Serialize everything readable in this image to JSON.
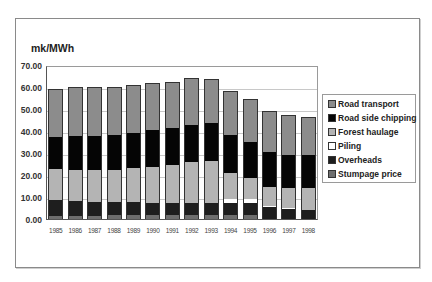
{
  "chart_data": {
    "type": "bar",
    "stacked": true,
    "title": "",
    "ylabel": "mk/MWh",
    "xlabel": "",
    "ylim": [
      0,
      70
    ],
    "yticks": [
      "0.00",
      "10.00",
      "20.00",
      "30.00",
      "40.00",
      "50.00",
      "60.00",
      "70.00"
    ],
    "grid": true,
    "legend_position": "right",
    "categories": [
      "1985",
      "1986",
      "1987",
      "1988",
      "1989",
      "1990",
      "1991",
      "1992",
      "1993",
      "1994",
      "1995",
      "1996",
      "1997",
      "1998"
    ],
    "series": [
      {
        "name": "Stumpage price",
        "color": "#6e6e6e",
        "values": [
          1.5,
          1.5,
          1.5,
          1.7,
          1.7,
          1.7,
          2.0,
          2.0,
          2.0,
          2.0,
          2.0,
          0.0,
          0.0,
          0.0
        ]
      },
      {
        "name": "Overheads",
        "color": "#1e1e1e",
        "values": [
          7.0,
          6.6,
          6.3,
          6.2,
          6.1,
          5.8,
          5.5,
          5.5,
          5.5,
          5.5,
          5.5,
          5.3,
          4.5,
          4.0
        ]
      },
      {
        "name": "Piling",
        "color": "#ffffff",
        "values": [
          0.0,
          0.0,
          0.0,
          0.0,
          0.0,
          0.0,
          0.0,
          0.0,
          0.0,
          1.8,
          1.8,
          0.7,
          0.5,
          0.0
        ]
      },
      {
        "name": "Forest haulage",
        "color": "#b4b4b4",
        "values": [
          14.2,
          14.4,
          14.6,
          14.5,
          15.4,
          16.3,
          17.1,
          18.3,
          18.7,
          11.6,
          9.3,
          8.6,
          9.2,
          10.0
        ]
      },
      {
        "name": "Road side chipping",
        "color": "#050505",
        "values": [
          14.6,
          15.2,
          15.3,
          15.8,
          16.0,
          16.7,
          16.6,
          16.9,
          17.3,
          17.5,
          16.4,
          15.9,
          15.1,
          15.3
        ]
      },
      {
        "name": "Road transport",
        "color": "#8c8c8c",
        "values": [
          22.0,
          22.1,
          22.1,
          21.9,
          21.8,
          21.3,
          21.3,
          21.3,
          20.3,
          19.6,
          19.4,
          18.5,
          18.0,
          17.0
        ]
      }
    ],
    "totals": [
      59.3,
      59.8,
      59.8,
      60.1,
      61.0,
      61.8,
      62.5,
      64.0,
      63.8,
      58.0,
      54.4,
      49.0,
      47.3,
      46.3
    ]
  },
  "legend": {
    "items": [
      {
        "label": "Road transport",
        "color": "#8c8c8c"
      },
      {
        "label": "Road side chipping",
        "color": "#050505"
      },
      {
        "label": "Forest haulage",
        "color": "#b4b4b4"
      },
      {
        "label": "Piling",
        "color": "#ffffff"
      },
      {
        "label": "Overheads",
        "color": "#1e1e1e"
      },
      {
        "label": "Stumpage price",
        "color": "#6e6e6e"
      }
    ]
  }
}
